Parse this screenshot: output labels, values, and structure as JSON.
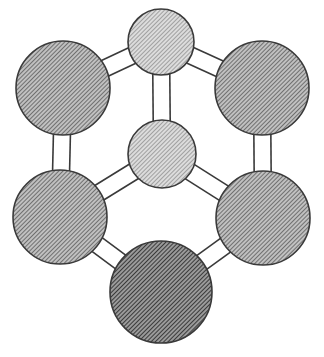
{
  "diagram": {
    "title": "",
    "colors": {
      "background": "#ffffff",
      "outline": "#3a3a3a",
      "hatch_light_bg": "#d8d8d8",
      "hatch_light_line": "#6e6e6e",
      "hatch_medium_bg": "#b4b4b4",
      "hatch_medium_line": "#474747",
      "hatch_dark_bg": "#8a8a8a",
      "hatch_dark_line": "#2a2a2a"
    },
    "nodes": [
      {
        "id": "top-center",
        "cx": 161,
        "cy": 42,
        "r": 33,
        "shade": "light"
      },
      {
        "id": "top-left",
        "cx": 63,
        "cy": 88,
        "r": 47,
        "shade": "medium"
      },
      {
        "id": "top-right",
        "cx": 262,
        "cy": 88,
        "r": 47,
        "shade": "medium"
      },
      {
        "id": "middle-center",
        "cx": 162,
        "cy": 154,
        "r": 34,
        "shade": "light"
      },
      {
        "id": "bottom-left",
        "cx": 60,
        "cy": 217,
        "r": 47,
        "shade": "medium"
      },
      {
        "id": "bottom-right",
        "cx": 263,
        "cy": 218,
        "r": 47,
        "shade": "medium"
      },
      {
        "id": "bottom-center",
        "cx": 161,
        "cy": 292,
        "r": 51,
        "shade": "dark"
      }
    ],
    "edges": [
      {
        "from": "top-center",
        "to": "top-left",
        "type": "double"
      },
      {
        "from": "top-center",
        "to": "top-right",
        "type": "double"
      },
      {
        "from": "top-center",
        "to": "middle-center",
        "type": "double"
      },
      {
        "from": "top-left",
        "to": "bottom-left",
        "type": "double"
      },
      {
        "from": "top-right",
        "to": "bottom-right",
        "type": "double"
      },
      {
        "from": "middle-center",
        "to": "bottom-left",
        "type": "double"
      },
      {
        "from": "middle-center",
        "to": "bottom-right",
        "type": "double"
      },
      {
        "from": "bottom-left",
        "to": "bottom-center",
        "type": "double"
      },
      {
        "from": "bottom-right",
        "to": "bottom-center",
        "type": "double"
      }
    ]
  }
}
